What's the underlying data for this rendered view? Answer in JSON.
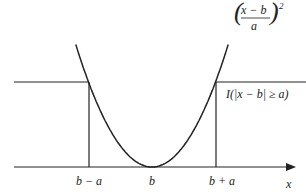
{
  "figure": {
    "curves": {
      "parabola": {
        "label_num": "x − b",
        "label_den": "a",
        "label_exp": "2"
      },
      "indicator": {
        "label": "I(|x − b| ≥ a)"
      }
    },
    "x_axis": {
      "label": "x",
      "ticks": [
        {
          "pos": -1,
          "label": "b − a"
        },
        {
          "pos": 0,
          "label": "b"
        },
        {
          "pos": 1,
          "label": "b + a"
        }
      ]
    },
    "indicator_level": 1,
    "colors": {
      "line": "#222222",
      "background": "#ffffff"
    }
  }
}
